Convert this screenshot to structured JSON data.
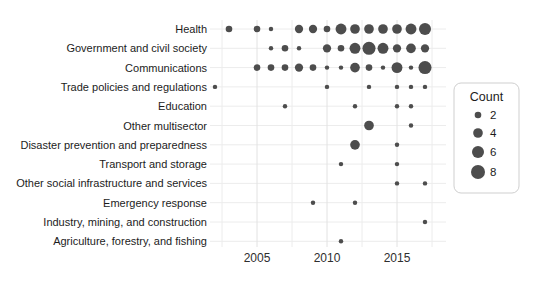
{
  "colors": {
    "dot": "#4d4d4d",
    "grid_major": "#e2e2e2",
    "grid_minor": "#ececec",
    "legend_border": "#cfcfcf",
    "background": "#ffffff",
    "label_text": "#1c1c1c",
    "tick_text": "#2e2e2e"
  },
  "chart_data": {
    "type": "scatter",
    "variant": "bubble-dot-plot",
    "title": "",
    "xlabel": "",
    "ylabel": "",
    "grid": true,
    "x_ticks": [
      2005,
      2010,
      2015
    ],
    "x_tick_labels": [
      "2005",
      "2010",
      "2015"
    ],
    "x_minor_gridlines": [
      2002.5,
      2005,
      2007.5,
      2010,
      2012.5,
      2015,
      2017.5
    ],
    "x_range": [
      2001.5,
      2018.5
    ],
    "legend": {
      "title": "Count",
      "position": "right",
      "sizes": [
        2,
        4,
        6,
        8
      ],
      "size_labels": [
        "2",
        "4",
        "6",
        "8"
      ]
    },
    "categories": [
      "Health",
      "Government and civil society",
      "Communications",
      "Trade policies and regulations",
      "Education",
      "Other multisector",
      "Disaster prevention and preparedness",
      "Transport and storage",
      "Other social infrastructure and services",
      "Emergency response",
      "Industry, mining, and construction",
      "Agriculture, forestry, and fishing"
    ],
    "series": [
      {
        "category": "Health",
        "points": [
          {
            "year": 2003,
            "count": 2
          },
          {
            "year": 2005,
            "count": 2
          },
          {
            "year": 2006,
            "count": 1
          },
          {
            "year": 2008,
            "count": 3
          },
          {
            "year": 2009,
            "count": 3
          },
          {
            "year": 2010,
            "count": 2
          },
          {
            "year": 2011,
            "count": 5
          },
          {
            "year": 2012,
            "count": 4
          },
          {
            "year": 2013,
            "count": 4
          },
          {
            "year": 2014,
            "count": 4
          },
          {
            "year": 2015,
            "count": 4
          },
          {
            "year": 2016,
            "count": 5
          },
          {
            "year": 2017,
            "count": 6
          }
        ]
      },
      {
        "category": "Government and civil society",
        "points": [
          {
            "year": 2006,
            "count": 1
          },
          {
            "year": 2007,
            "count": 2
          },
          {
            "year": 2008,
            "count": 1
          },
          {
            "year": 2010,
            "count": 3
          },
          {
            "year": 2011,
            "count": 2
          },
          {
            "year": 2012,
            "count": 5
          },
          {
            "year": 2013,
            "count": 7
          },
          {
            "year": 2014,
            "count": 5
          },
          {
            "year": 2015,
            "count": 3
          },
          {
            "year": 2016,
            "count": 4
          },
          {
            "year": 2017,
            "count": 3
          }
        ]
      },
      {
        "category": "Communications",
        "points": [
          {
            "year": 2005,
            "count": 2
          },
          {
            "year": 2006,
            "count": 2
          },
          {
            "year": 2007,
            "count": 2
          },
          {
            "year": 2008,
            "count": 3
          },
          {
            "year": 2009,
            "count": 2
          },
          {
            "year": 2010,
            "count": 1
          },
          {
            "year": 2011,
            "count": 1
          },
          {
            "year": 2012,
            "count": 4
          },
          {
            "year": 2013,
            "count": 2
          },
          {
            "year": 2014,
            "count": 1
          },
          {
            "year": 2015,
            "count": 5
          },
          {
            "year": 2016,
            "count": 1
          },
          {
            "year": 2017,
            "count": 7
          }
        ]
      },
      {
        "category": "Trade policies and regulations",
        "points": [
          {
            "year": 2002,
            "count": 1
          },
          {
            "year": 2010,
            "count": 1
          },
          {
            "year": 2013,
            "count": 1
          },
          {
            "year": 2015,
            "count": 1
          },
          {
            "year": 2016,
            "count": 1
          },
          {
            "year": 2017,
            "count": 1
          }
        ]
      },
      {
        "category": "Education",
        "points": [
          {
            "year": 2007,
            "count": 1
          },
          {
            "year": 2012,
            "count": 1
          },
          {
            "year": 2015,
            "count": 1
          },
          {
            "year": 2016,
            "count": 1
          }
        ]
      },
      {
        "category": "Other multisector",
        "points": [
          {
            "year": 2013,
            "count": 4
          },
          {
            "year": 2016,
            "count": 1
          }
        ]
      },
      {
        "category": "Disaster prevention and preparedness",
        "points": [
          {
            "year": 2012,
            "count": 4
          },
          {
            "year": 2015,
            "count": 1
          }
        ]
      },
      {
        "category": "Transport and storage",
        "points": [
          {
            "year": 2011,
            "count": 1
          },
          {
            "year": 2015,
            "count": 1
          }
        ]
      },
      {
        "category": "Other social infrastructure and services",
        "points": [
          {
            "year": 2015,
            "count": 1
          },
          {
            "year": 2017,
            "count": 1
          }
        ]
      },
      {
        "category": "Emergency response",
        "points": [
          {
            "year": 2009,
            "count": 1
          },
          {
            "year": 2012,
            "count": 1
          }
        ]
      },
      {
        "category": "Industry, mining, and construction",
        "points": [
          {
            "year": 2017,
            "count": 1
          }
        ]
      },
      {
        "category": "Agriculture, forestry, and fishing",
        "points": [
          {
            "year": 2011,
            "count": 1
          }
        ]
      }
    ]
  }
}
